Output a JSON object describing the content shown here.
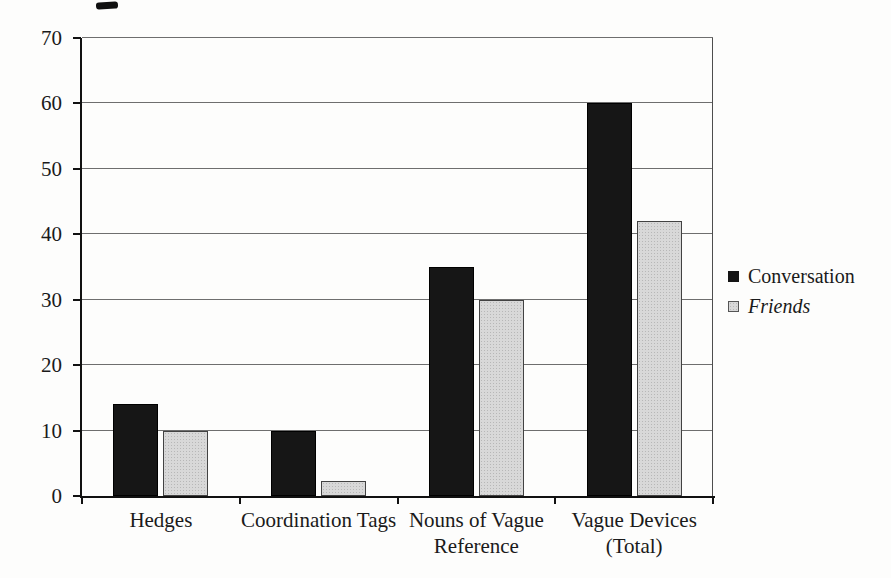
{
  "chart_data": {
    "type": "bar",
    "title": "",
    "xlabel": "",
    "ylabel": "",
    "categories": [
      "Hedges",
      "Coordination Tags",
      "Nouns of Vague Reference",
      "Vague Devices (Total)"
    ],
    "category_label_lines": [
      [
        "Hedges"
      ],
      [
        "Coordination Tags"
      ],
      [
        "Nouns of Vague",
        "Reference"
      ],
      [
        "Vague Devices",
        "(Total)"
      ]
    ],
    "series": [
      {
        "name": "Conversation",
        "values": [
          14,
          10,
          35,
          60
        ],
        "fill": "#161616",
        "text_style": "normal"
      },
      {
        "name": "Friends",
        "values": [
          10,
          2.3,
          30,
          42
        ],
        "fill": "#d8d8d8",
        "text_style": "italic"
      }
    ],
    "ylim": [
      0,
      70
    ],
    "yticks": [
      0,
      10,
      20,
      30,
      40,
      50,
      60,
      70
    ],
    "grid": "horizontal-gridlines",
    "legend_position": "right-middle"
  },
  "legend": {
    "items": [
      {
        "label": "Conversation",
        "swatch": "black-square"
      },
      {
        "label": "Friends",
        "swatch": "gray-dotted-square"
      }
    ]
  },
  "colors": {
    "conversation_bar": "#161616",
    "friends_bar": "#d8d8d8",
    "gridline": "#6e6e6e",
    "axis": "#111111",
    "text": "#1a1a1a",
    "background": "#fdfdfc"
  }
}
